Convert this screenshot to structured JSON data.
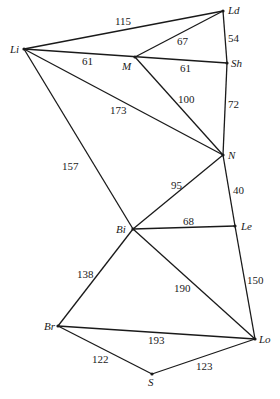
{
  "nodes": {
    "Li": {
      "label": "Li"
    },
    "Ld": {
      "label": "Ld"
    },
    "M": {
      "label": "M"
    },
    "Sh": {
      "label": "Sh"
    },
    "N": {
      "label": "N"
    },
    "Bi": {
      "label": "Bi"
    },
    "Le": {
      "label": "Le"
    },
    "Br": {
      "label": "Br"
    },
    "Lo": {
      "label": "Lo"
    },
    "S": {
      "label": "S"
    }
  },
  "edges": {
    "Li_Ld": {
      "from": "Li",
      "to": "Ld",
      "weight": "115"
    },
    "Li_Sh": {
      "from": "Li",
      "to": "Sh",
      "weight": "61"
    },
    "M_Ld": {
      "from": "M",
      "to": "Ld",
      "weight": "67"
    },
    "M_Sh": {
      "from": "M",
      "to": "Sh",
      "weight": "61"
    },
    "Ld_Sh": {
      "from": "Ld",
      "to": "Sh",
      "weight": "54"
    },
    "Li_N": {
      "from": "Li",
      "to": "N",
      "weight": "173"
    },
    "M_N": {
      "from": "M",
      "to": "N",
      "weight": "100"
    },
    "Sh_N": {
      "from": "Sh",
      "to": "N",
      "weight": "72"
    },
    "Li_Bi": {
      "from": "Li",
      "to": "Bi",
      "weight": "157"
    },
    "Bi_N": {
      "from": "Bi",
      "to": "N",
      "weight": "95"
    },
    "N_Le": {
      "from": "N",
      "to": "Le",
      "weight": "40"
    },
    "Bi_Le": {
      "from": "Bi",
      "to": "Le",
      "weight": "68"
    },
    "Bi_Br": {
      "from": "Bi",
      "to": "Br",
      "weight": "138"
    },
    "Bi_Lo": {
      "from": "Bi",
      "to": "Lo",
      "weight": "190"
    },
    "Le_Lo": {
      "from": "Le",
      "to": "Lo",
      "weight": "150"
    },
    "Br_Lo": {
      "from": "Br",
      "to": "Lo",
      "weight": "193"
    },
    "Br_S": {
      "from": "Br",
      "to": "S",
      "weight": "122"
    },
    "S_Lo": {
      "from": "S",
      "to": "Lo",
      "weight": "123"
    }
  }
}
